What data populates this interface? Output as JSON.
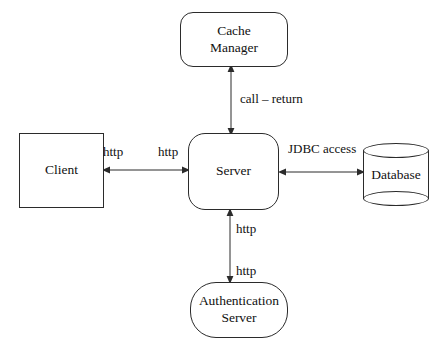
{
  "diagram": {
    "background_color": "#ffffff",
    "stroke_color": "#2b2b2b",
    "text_color": "#111111",
    "nodes": [
      {
        "id": "cache-manager",
        "shape": "rounded-rectangle",
        "lines": [
          "Cache",
          "Manager"
        ]
      },
      {
        "id": "client",
        "shape": "rectangle",
        "lines": [
          "Client"
        ]
      },
      {
        "id": "server",
        "shape": "rounded-rectangle",
        "lines": [
          "Server"
        ]
      },
      {
        "id": "database",
        "shape": "cylinder",
        "lines": [
          "Database"
        ]
      },
      {
        "id": "auth-server",
        "shape": "stadium",
        "lines": [
          "Authentication",
          "Server"
        ]
      }
    ],
    "edges": [
      {
        "id": "server-cache-manager",
        "from": "server",
        "to": "cache-manager",
        "direction": "bidirectional",
        "orientation": "vertical",
        "labels": [
          "call – return"
        ]
      },
      {
        "id": "client-server",
        "from": "client",
        "to": "server",
        "direction": "bidirectional",
        "orientation": "horizontal",
        "labels": [
          "http",
          "http"
        ]
      },
      {
        "id": "server-database",
        "from": "server",
        "to": "database",
        "direction": "bidirectional",
        "orientation": "horizontal",
        "labels": [
          "JDBC access"
        ]
      },
      {
        "id": "server-auth-server",
        "from": "server",
        "to": "auth-server",
        "direction": "bidirectional",
        "orientation": "vertical",
        "labels": [
          "http",
          "http"
        ]
      }
    ],
    "labels": {
      "cache_manager_line1": "Cache",
      "cache_manager_line2": "Manager",
      "client": "Client",
      "server": "Server",
      "database": "Database",
      "auth_server_line1": "Authentication",
      "auth_server_line2": "Server",
      "call_return": "call – return",
      "jdbc_access": "JDBC access",
      "http_client_side": "http",
      "http_server_left": "http",
      "http_server_bottom": "http",
      "http_auth_top": "http"
    }
  }
}
